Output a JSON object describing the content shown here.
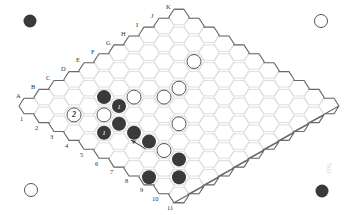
{
  "figure": {
    "board_size": 11,
    "row_labels": [
      "A",
      "B",
      "C",
      "D",
      "E",
      "F",
      "G",
      "H",
      "I",
      "J",
      "K"
    ],
    "col_labels": [
      "1",
      "2",
      "3",
      "4",
      "5",
      "6",
      "7",
      "8",
      "9",
      "10",
      "11"
    ],
    "colors": {
      "black": "#3a3a3a",
      "white": "#ffffff",
      "grid": "#d6d6d6",
      "edge": "#6a6a6a"
    },
    "stones": [
      {
        "cell": "D3",
        "color": "black",
        "mark": ""
      },
      {
        "cell": "D4",
        "color": "black",
        "mark": "1"
      },
      {
        "cell": "C5",
        "color": "black",
        "mark": ""
      },
      {
        "cell": "B5",
        "color": "black",
        "mark": "1"
      },
      {
        "cell": "C6",
        "color": "black",
        "mark": ""
      },
      {
        "cell": "C7",
        "color": "black",
        "mark": ""
      },
      {
        "cell": "C9",
        "color": "black",
        "mark": ""
      },
      {
        "cell": "A9",
        "color": "black",
        "mark": ""
      },
      {
        "cell": "B10",
        "color": "black",
        "mark": ""
      },
      {
        "cell": "B3",
        "color": "white",
        "mark": "2"
      },
      {
        "cell": "C4",
        "color": "white",
        "mark": ""
      },
      {
        "cell": "E4",
        "color": "white",
        "mark": ""
      },
      {
        "cell": "F5",
        "color": "white",
        "mark": ""
      },
      {
        "cell": "G5",
        "color": "white",
        "mark": ""
      },
      {
        "cell": "I4",
        "color": "white",
        "mark": ""
      },
      {
        "cell": "E7",
        "color": "white",
        "mark": ""
      },
      {
        "cell": "C8",
        "color": "white",
        "mark": ""
      }
    ],
    "arrow": {
      "from": [
        146,
        149
      ],
      "to": [
        131,
        140
      ]
    },
    "corner_stones": [
      {
        "position": "top-left",
        "color": "black"
      },
      {
        "position": "top-right",
        "color": "white"
      },
      {
        "position": "bottom-left",
        "color": "white"
      },
      {
        "position": "bottom-right",
        "color": "black"
      }
    ],
    "page_number": "503"
  }
}
